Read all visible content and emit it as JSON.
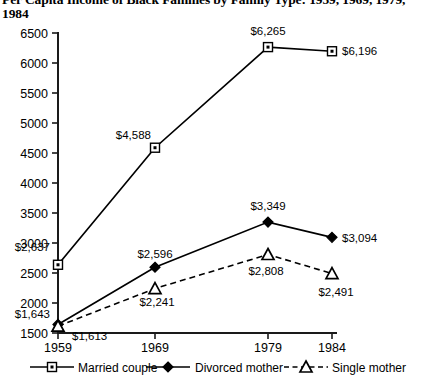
{
  "title": "Per Capita Income of Black Families by Family Type: 1959, 1969, 1979, 1984",
  "chart_data": {
    "type": "line",
    "title": "Per Capita Income of Black Families by Family Type: 1959, 1969, 1979, 1984",
    "xlabel": "",
    "ylabel": "",
    "categories": [
      "1959",
      "1969",
      "1979",
      "1984"
    ],
    "x": [
      1959,
      1969,
      1979,
      1984
    ],
    "ylim": [
      1500,
      6500
    ],
    "yticks": [
      1500,
      2000,
      2500,
      3000,
      3500,
      4000,
      4500,
      5000,
      5500,
      6000,
      6500
    ],
    "ytick_labels": [
      "1500",
      "2000",
      "2500",
      "3000",
      "3500",
      "4000",
      "4500",
      "5000",
      "5500",
      "6000",
      "6500"
    ],
    "grid": false,
    "legend_position": "bottom",
    "series": [
      {
        "name": "Married couple",
        "marker": "square",
        "line_style": "solid",
        "values": [
          2637,
          4588,
          6265,
          6196
        ],
        "labels": [
          "$2,637",
          "$4,588",
          "$6,265",
          "$6,196"
        ]
      },
      {
        "name": "Divorced mother",
        "marker": "diamond",
        "line_style": "solid",
        "values": [
          1643,
          2596,
          3349,
          3094
        ],
        "labels": [
          "$1,643",
          "$2,596",
          "$3,349",
          "$3,094"
        ]
      },
      {
        "name": "Single mother",
        "marker": "triangle",
        "line_style": "dashed",
        "values": [
          1613,
          2241,
          2808,
          2491
        ],
        "labels": [
          "$1,613",
          "$2,241",
          "$2,808",
          "$2,491"
        ]
      }
    ]
  },
  "legend": {
    "items": [
      {
        "label": "Married couple",
        "marker": "square",
        "line_style": "solid"
      },
      {
        "label": "Divorced mother",
        "marker": "diamond",
        "line_style": "solid"
      },
      {
        "label": "Single mother",
        "marker": "triangle",
        "line_style": "dashed"
      }
    ]
  },
  "colors": {
    "ink": "#000000",
    "axis": "#1a1a1a",
    "background": "#ffffff"
  }
}
